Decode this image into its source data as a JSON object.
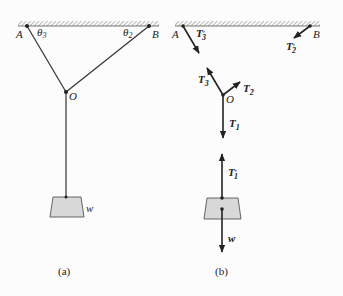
{
  "figure_a": {
    "caption": "(a)",
    "points": {
      "A": "A",
      "B": "B",
      "O": "O"
    },
    "angles": {
      "theta3": "θ",
      "theta3_sub": "3",
      "theta2": "θ",
      "theta2_sub": "2"
    },
    "weight_label": "w"
  },
  "figure_b": {
    "caption": "(b)",
    "points": {
      "A": "A",
      "B": "B",
      "O": "O"
    },
    "forces": {
      "T3p": {
        "base": "T",
        "sub": "3",
        "prime": "′"
      },
      "T2p": {
        "base": "T",
        "sub": "2",
        "prime": "′"
      },
      "T3": {
        "base": "T",
        "sub": "3"
      },
      "T2": {
        "base": "T",
        "sub": "2"
      },
      "T1": {
        "base": "T",
        "sub": "1"
      },
      "T1p": {
        "base": "T",
        "sub": "1",
        "prime": "′"
      },
      "w": "w"
    }
  },
  "colors": {
    "line": "#333333",
    "weight_fill": "#d8d8d8",
    "hatch": "#777777"
  }
}
